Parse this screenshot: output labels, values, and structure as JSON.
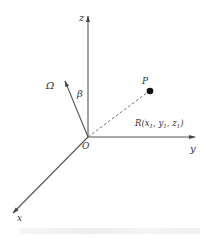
{
  "diagram": {
    "colors": {
      "axis": "#555555",
      "point": "#111111",
      "text": "#333333"
    },
    "axes": {
      "z_label": "z",
      "y_label": "y",
      "x_label": "x",
      "origin_label": "O"
    },
    "omega_label": "Ω",
    "beta_label": "β",
    "point_label": "P",
    "position_vector": {
      "label_prefix": "R(",
      "x": "x",
      "x_sub": "1",
      "y": "y",
      "y_sub": "1",
      "z": "z",
      "z_sub": "1",
      "sep": ", ",
      "label_suffix": ")"
    }
  }
}
